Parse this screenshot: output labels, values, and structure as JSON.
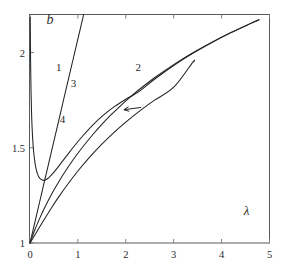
{
  "figure": {
    "panel_label": "b",
    "background": "#ffffff",
    "line_color": "#232323",
    "frame_color": "#555a5e"
  },
  "chart_data": {
    "type": "line",
    "title": "",
    "panel": "b",
    "xlabel": "λ",
    "ylabel": "b",
    "xlim": [
      0,
      5
    ],
    "ylim": [
      1,
      2.2
    ],
    "grid": false,
    "legend": "inline-curve-numbers",
    "xticks": [
      0,
      1,
      2,
      3,
      4,
      5
    ],
    "xticklabels": [
      "0",
      "1",
      "2",
      "3",
      "4",
      "5"
    ],
    "yticks": [
      1,
      1.5,
      2
    ],
    "yticklabels": [
      "1",
      "1.5",
      "2"
    ],
    "annotations": [
      {
        "text": "1",
        "x": 0.6,
        "y": 1.905,
        "target": "curve-1"
      },
      {
        "text": "2",
        "x": 2.26,
        "y": 1.905,
        "target": "curve-2"
      },
      {
        "text": "3",
        "x": 0.91,
        "y": 1.82,
        "target": "curve-3"
      },
      {
        "text": "4",
        "x": 0.68,
        "y": 1.632,
        "target": "curve-4"
      },
      {
        "text": "λ",
        "x": 4.52,
        "y": 1.145,
        "target": "x-axis-title"
      },
      {
        "text": "b",
        "x": 0.42,
        "y": 2.152,
        "target": "panel-label"
      }
    ],
    "arrow": {
      "from": {
        "x": 2.32,
        "y": 1.712
      },
      "to": {
        "x": 1.96,
        "y": 1.7
      },
      "note": "leader arrow pointing to curve 2 at the crossing"
    },
    "series": [
      {
        "name": "1",
        "label": "1",
        "points": [
          [
            0.0,
            1.0
          ],
          [
            0.1,
            1.107
          ],
          [
            0.2,
            1.214
          ],
          [
            0.3,
            1.322
          ],
          [
            0.4,
            1.429
          ],
          [
            0.5,
            1.536
          ],
          [
            0.6,
            1.643
          ],
          [
            0.7,
            1.751
          ],
          [
            0.8,
            1.858
          ],
          [
            0.9,
            1.965
          ],
          [
            1.0,
            2.072
          ],
          [
            1.12,
            2.2
          ]
        ]
      },
      {
        "name": "2",
        "label": "2",
        "points": [
          [
            0.0,
            1.0
          ],
          [
            0.05,
            1.035
          ],
          [
            0.1,
            1.068
          ],
          [
            0.2,
            1.128
          ],
          [
            0.3,
            1.182
          ],
          [
            0.4,
            1.232
          ],
          [
            0.5,
            1.278
          ],
          [
            0.7,
            1.362
          ],
          [
            0.9,
            1.437
          ],
          [
            1.1,
            1.504
          ],
          [
            1.3,
            1.566
          ],
          [
            1.5,
            1.623
          ],
          [
            1.7,
            1.675
          ],
          [
            1.9,
            1.723
          ],
          [
            2.05,
            1.757
          ],
          [
            2.3,
            1.81
          ],
          [
            2.6,
            1.868
          ],
          [
            3.0,
            1.937
          ],
          [
            3.4,
            1.999
          ],
          [
            3.8,
            2.055
          ],
          [
            4.2,
            2.106
          ],
          [
            4.6,
            2.152
          ],
          [
            4.78,
            2.172
          ]
        ]
      },
      {
        "name": "3",
        "label": "3",
        "points": [
          [
            0.005,
            2.185
          ],
          [
            0.012,
            1.96
          ],
          [
            0.022,
            1.79
          ],
          [
            0.035,
            1.66
          ],
          [
            0.055,
            1.552
          ],
          [
            0.08,
            1.47
          ],
          [
            0.11,
            1.412
          ],
          [
            0.145,
            1.372
          ],
          [
            0.185,
            1.347
          ],
          [
            0.23,
            1.334
          ],
          [
            0.28,
            1.329
          ],
          [
            0.33,
            1.332
          ],
          [
            0.4,
            1.345
          ],
          [
            0.5,
            1.372
          ],
          [
            0.62,
            1.41
          ],
          [
            0.76,
            1.456
          ],
          [
            0.92,
            1.508
          ],
          [
            1.1,
            1.562
          ],
          [
            1.3,
            1.617
          ],
          [
            1.52,
            1.669
          ],
          [
            1.76,
            1.716
          ],
          [
            2.0,
            1.755
          ],
          [
            2.15,
            1.776
          ],
          [
            2.3,
            1.8
          ],
          [
            2.6,
            1.86
          ],
          [
            3.0,
            1.932
          ],
          [
            3.4,
            1.996
          ],
          [
            3.8,
            2.053
          ],
          [
            4.2,
            2.105
          ],
          [
            4.6,
            2.152
          ],
          [
            4.78,
            2.172
          ]
        ]
      },
      {
        "name": "4",
        "label": "4",
        "points": [
          [
            0.0,
            1.0
          ],
          [
            0.06,
            1.024
          ],
          [
            0.12,
            1.05
          ],
          [
            0.22,
            1.092
          ],
          [
            0.32,
            1.133
          ],
          [
            0.45,
            1.185
          ],
          [
            0.6,
            1.242
          ],
          [
            0.78,
            1.306
          ],
          [
            1.0,
            1.378
          ],
          [
            1.25,
            1.452
          ],
          [
            1.5,
            1.519
          ],
          [
            1.75,
            1.58
          ],
          [
            2.0,
            1.635
          ],
          [
            2.3,
            1.695
          ],
          [
            2.6,
            1.75
          ],
          [
            3.0,
            1.818
          ],
          [
            3.4,
            1.95
          ],
          [
            3.42,
            1.952
          ]
        ]
      }
    ]
  }
}
